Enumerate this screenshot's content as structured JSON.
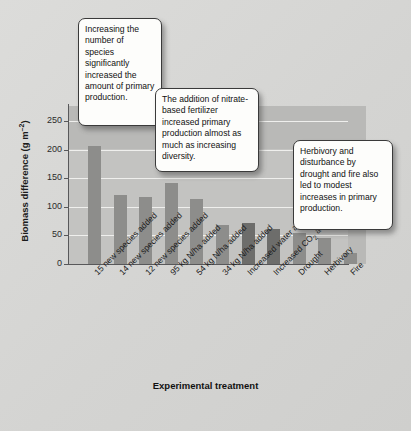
{
  "chart_data": {
    "type": "bar",
    "title": "",
    "xlabel": "Experimental treatment",
    "ylabel": "Biomass difference (g m⁻²)",
    "ylabel_main": "Biomass difference (g m",
    "ylabel_sup": "–2",
    "ylabel_tail": ")",
    "ylim": [
      0,
      250
    ],
    "ytick_values": [
      250,
      200,
      150,
      100,
      50,
      0
    ],
    "ytick_labels": [
      "250",
      "200",
      "150",
      "100",
      "50",
      "0"
    ],
    "grid": true,
    "legend": "none",
    "categories": [
      "15 new species added",
      "14 new species added",
      "12 new species added",
      "95 kg N/ha added",
      "54 kg N/ha added",
      "34 kg N/ha added",
      "Increased water availability",
      "Increased CO2 availability",
      "Drought",
      "Herbivory",
      "Fire"
    ],
    "category_labels_html": [
      "15 new species added",
      "14 new species added",
      "12 new species added",
      "95 kg N/ha added",
      "54 kg N/ha added",
      "34 kg N/ha added",
      "Increased water availability",
      "Increased CO₂ availability",
      "Drought",
      "Herbivory",
      "Fire"
    ],
    "values": [
      207,
      120,
      117,
      142,
      113,
      68,
      71,
      62,
      54,
      46,
      19
    ],
    "bar_shades": [
      "light",
      "light",
      "light",
      "light",
      "light",
      "light",
      "dark",
      "dark",
      "light",
      "light",
      "light"
    ],
    "colors": {
      "bar_light": "#8d8d8b",
      "bar_dark": "#6d6d6b",
      "panel_upper": "#b9b9b7",
      "panel_lower": "#c3c3c1",
      "gridline": "#efefed",
      "axis": "#58585a",
      "background": "#d8d8d6",
      "callout_fill": "#fdfdfb",
      "callout_border": "#3a3a3a"
    }
  },
  "callouts": [
    {
      "id": "callout-1",
      "text": "Increasing the number of species significantly increased the amount of primary production."
    },
    {
      "id": "callout-2",
      "text": "The addition of nitrate-based fertilizer increased primary production almost as much as increasing diversity."
    },
    {
      "id": "callout-3",
      "text": "Herbivory and disturbance by drought and fire also led to modest increases in primary production."
    }
  ]
}
